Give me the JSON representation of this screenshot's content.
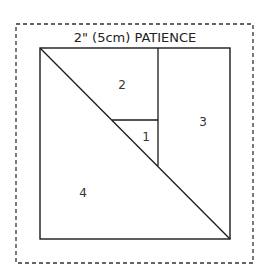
{
  "diagram": {
    "title": "2\" (5cm) PATIENCE",
    "pieces": [
      {
        "id": "1",
        "label": "1"
      },
      {
        "id": "2",
        "label": "2"
      },
      {
        "id": "3",
        "label": "3"
      },
      {
        "id": "4",
        "label": "4"
      }
    ],
    "colors": {
      "line": "#1a1a1a",
      "dash": "#333333",
      "background": "#ffffff"
    }
  }
}
